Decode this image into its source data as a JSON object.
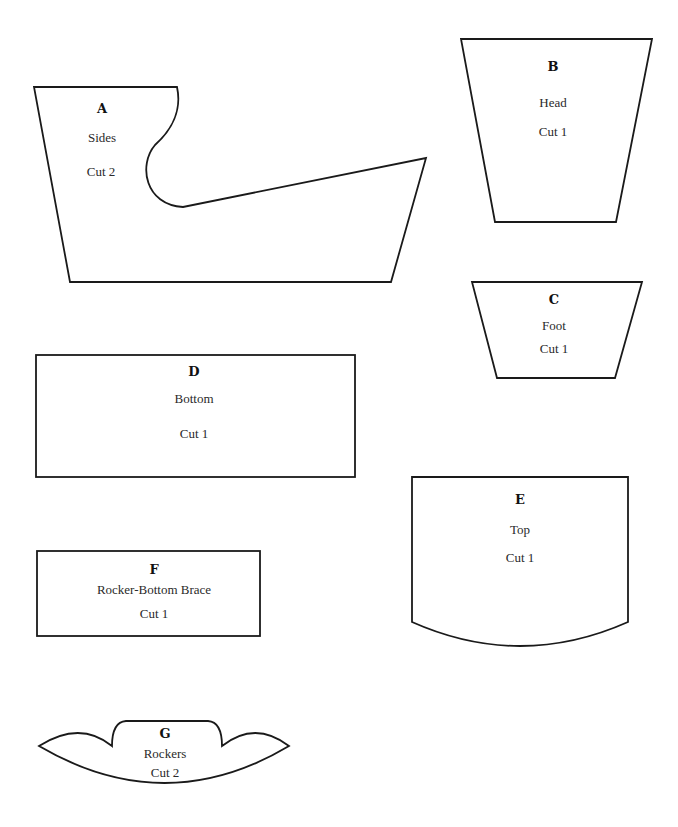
{
  "pieces": {
    "A": {
      "letter": "A",
      "name": "Sides",
      "cut": "Cut 2"
    },
    "B": {
      "letter": "B",
      "name": "Head",
      "cut": "Cut 1"
    },
    "C": {
      "letter": "C",
      "name": "Foot",
      "cut": "Cut 1"
    },
    "D": {
      "letter": "D",
      "name": "Bottom",
      "cut": "Cut 1"
    },
    "E": {
      "letter": "E",
      "name": "Top",
      "cut": "Cut 1"
    },
    "F": {
      "letter": "F",
      "name": "Rocker-Bottom Brace",
      "cut": "Cut 1"
    },
    "G": {
      "letter": "G",
      "name": "Rockers",
      "cut": "Cut 2"
    }
  },
  "colors": {
    "outline": "#1a1a1a",
    "background": "#ffffff"
  }
}
